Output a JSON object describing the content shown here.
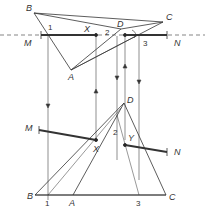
{
  "figure": {
    "top_view": {
      "labels": {
        "A": "A",
        "B": "B",
        "C": "C",
        "D": "D",
        "X": "X",
        "Y": "Y",
        "M": "M",
        "N": "N"
      },
      "points": {
        "1": "1",
        "2": "2",
        "3": "3"
      }
    },
    "front_view": {
      "labels": {
        "A": "A",
        "B": "B",
        "C": "C",
        "D": "D",
        "X": "X",
        "Y": "Y",
        "M": "M",
        "N": "N"
      },
      "points": {
        "1": "1",
        "2": "2",
        "3": "3"
      }
    },
    "colors": {
      "line": "#222222",
      "thin": "#555555"
    }
  }
}
